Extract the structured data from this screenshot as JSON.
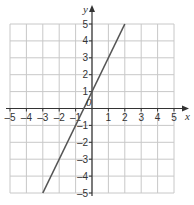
{
  "chart_data": {
    "type": "line",
    "title": "",
    "xlabel": "x",
    "ylabel": "y",
    "xlim": [
      -5,
      5
    ],
    "ylim": [
      -5,
      5
    ],
    "grid": true,
    "x_ticks": [
      -5,
      -4,
      -3,
      -2,
      -1,
      1,
      2,
      3,
      4,
      5
    ],
    "y_ticks": [
      -5,
      -4,
      -3,
      -2,
      -1,
      1,
      2,
      3,
      4,
      5
    ],
    "x_tick_labels": [
      "–5",
      "–4",
      "–3",
      "–2",
      "–1",
      "1",
      "2",
      "3",
      "4",
      "5"
    ],
    "y_tick_labels": [
      "–5",
      "–4",
      "–3",
      "–2",
      "–1",
      "1",
      "2",
      "3",
      "4",
      "5"
    ],
    "origin_label": "0",
    "series": [
      {
        "name": "y = 2x + 1",
        "x": [
          -3,
          2
        ],
        "y": [
          -5,
          5
        ],
        "color": "#555555"
      }
    ]
  },
  "colors": {
    "grid": "#c8c8c8",
    "axis": "#333333",
    "line": "#555555"
  }
}
